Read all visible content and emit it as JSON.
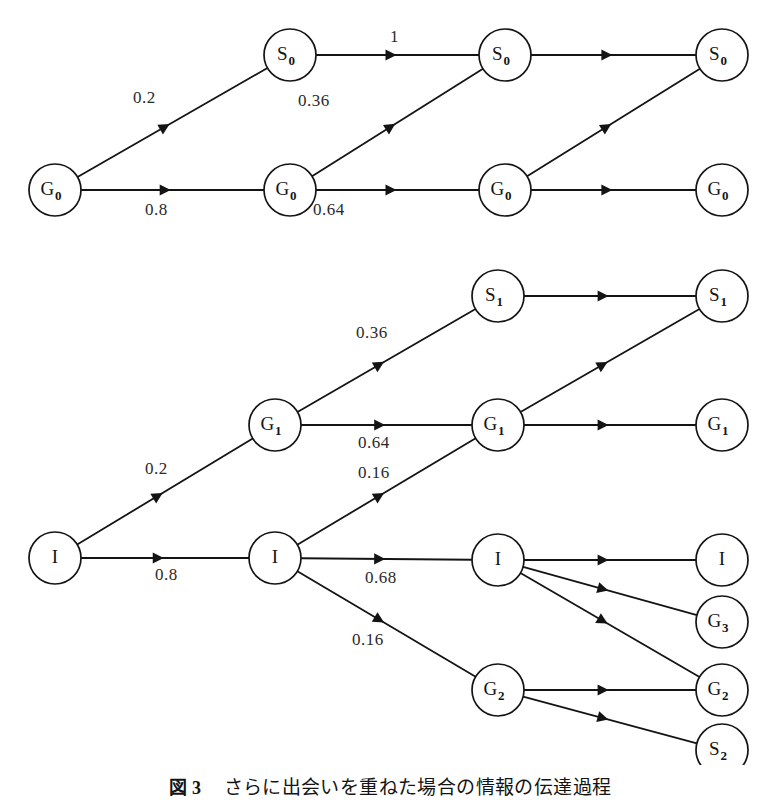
{
  "figure": {
    "caption_number": "図 3",
    "caption_text": "さらに出会いを重ねた場合の情報の伝達過程",
    "background_color": "#ffffff",
    "ink_color": "#141414"
  },
  "diagram_data": {
    "type": "diagram",
    "description": "Two stacked directed layered graphs (trellis diagrams) showing information transmission over repeated encounters; edges carry transition probabilities.",
    "panels": [
      {
        "id": "upper",
        "columns": 4,
        "nodes": [
          {
            "id": "u-c1-G0",
            "label": "G",
            "sub": "0",
            "col": 1,
            "x": 55,
            "y": 190
          },
          {
            "id": "u-c2-S0",
            "label": "S",
            "sub": "0",
            "col": 2,
            "x": 290,
            "y": 55
          },
          {
            "id": "u-c2-G0",
            "label": "G",
            "sub": "0",
            "col": 2,
            "x": 290,
            "y": 190
          },
          {
            "id": "u-c3-S0",
            "label": "S",
            "sub": "0",
            "col": 3,
            "x": 505,
            "y": 55
          },
          {
            "id": "u-c3-G0",
            "label": "G",
            "sub": "0",
            "col": 3,
            "x": 505,
            "y": 190
          },
          {
            "id": "u-c4-S0",
            "label": "S",
            "sub": "0",
            "col": 4,
            "x": 722,
            "y": 55
          },
          {
            "id": "u-c4-G0",
            "label": "G",
            "sub": "0",
            "col": 4,
            "x": 722,
            "y": 190
          }
        ],
        "edges": [
          {
            "from": "u-c1-G0",
            "to": "u-c2-S0",
            "label": "0.2",
            "label_x": 133,
            "label_y": 103
          },
          {
            "from": "u-c1-G0",
            "to": "u-c2-G0",
            "label": "0.8",
            "label_x": 145,
            "label_y": 215
          },
          {
            "from": "u-c2-S0",
            "to": "u-c3-S0",
            "label": "1",
            "label_x": 390,
            "label_y": 42
          },
          {
            "from": "u-c2-G0",
            "to": "u-c3-S0",
            "label": "0.36",
            "label_x": 298,
            "label_y": 106
          },
          {
            "from": "u-c2-G0",
            "to": "u-c3-G0",
            "label": "0.64",
            "label_x": 313,
            "label_y": 215
          },
          {
            "from": "u-c3-S0",
            "to": "u-c4-S0",
            "label": "",
            "label_x": 0,
            "label_y": 0
          },
          {
            "from": "u-c3-G0",
            "to": "u-c4-S0",
            "label": "",
            "label_x": 0,
            "label_y": 0
          },
          {
            "from": "u-c3-G0",
            "to": "u-c4-G0",
            "label": "",
            "label_x": 0,
            "label_y": 0
          }
        ]
      },
      {
        "id": "lower",
        "columns": 4,
        "nodes": [
          {
            "id": "l-c1-I",
            "label": "I",
            "sub": "",
            "col": 1,
            "x": 55,
            "y": 558
          },
          {
            "id": "l-c2-G1",
            "label": "G",
            "sub": "1",
            "col": 2,
            "x": 275,
            "y": 425
          },
          {
            "id": "l-c2-I",
            "label": "I",
            "sub": "",
            "col": 2,
            "x": 275,
            "y": 558
          },
          {
            "id": "l-c3-S1",
            "label": "S",
            "sub": "1",
            "col": 3,
            "x": 498,
            "y": 296
          },
          {
            "id": "l-c3-G1",
            "label": "G",
            "sub": "1",
            "col": 3,
            "x": 498,
            "y": 425
          },
          {
            "id": "l-c3-I",
            "label": "I",
            "sub": "",
            "col": 3,
            "x": 498,
            "y": 560
          },
          {
            "id": "l-c3-G2",
            "label": "G",
            "sub": "2",
            "col": 3,
            "x": 498,
            "y": 690
          },
          {
            "id": "l-c4-S1",
            "label": "S",
            "sub": "1",
            "col": 4,
            "x": 722,
            "y": 296
          },
          {
            "id": "l-c4-G1",
            "label": "G",
            "sub": "1",
            "col": 4,
            "x": 722,
            "y": 425
          },
          {
            "id": "l-c4-I",
            "label": "I",
            "sub": "",
            "col": 4,
            "x": 722,
            "y": 560
          },
          {
            "id": "l-c4-G3",
            "label": "G",
            "sub": "3",
            "col": 4,
            "x": 722,
            "y": 622
          },
          {
            "id": "l-c4-G2",
            "label": "G",
            "sub": "2",
            "col": 4,
            "x": 722,
            "y": 690
          },
          {
            "id": "l-c4-S2",
            "label": "S",
            "sub": "2",
            "col": 4,
            "x": 722,
            "y": 750
          }
        ],
        "edges": [
          {
            "from": "l-c1-I",
            "to": "l-c2-G1",
            "label": "0.2",
            "label_x": 145,
            "label_y": 474
          },
          {
            "from": "l-c1-I",
            "to": "l-c2-I",
            "label": "0.8",
            "label_x": 155,
            "label_y": 580
          },
          {
            "from": "l-c2-G1",
            "to": "l-c3-S1",
            "label": "0.36",
            "label_x": 356,
            "label_y": 338
          },
          {
            "from": "l-c2-G1",
            "to": "l-c3-G1",
            "label": "0.64",
            "label_x": 358,
            "label_y": 448
          },
          {
            "from": "l-c2-I",
            "to": "l-c3-G1",
            "label": "0.16",
            "label_x": 358,
            "label_y": 478
          },
          {
            "from": "l-c2-I",
            "to": "l-c3-I",
            "label": "0.68",
            "label_x": 365,
            "label_y": 583
          },
          {
            "from": "l-c2-I",
            "to": "l-c3-G2",
            "label": "0.16",
            "label_x": 352,
            "label_y": 645
          },
          {
            "from": "l-c3-S1",
            "to": "l-c4-S1",
            "label": "",
            "label_x": 0,
            "label_y": 0
          },
          {
            "from": "l-c3-G1",
            "to": "l-c4-S1",
            "label": "",
            "label_x": 0,
            "label_y": 0
          },
          {
            "from": "l-c3-G1",
            "to": "l-c4-G1",
            "label": "",
            "label_x": 0,
            "label_y": 0
          },
          {
            "from": "l-c3-I",
            "to": "l-c4-I",
            "label": "",
            "label_x": 0,
            "label_y": 0
          },
          {
            "from": "l-c3-I",
            "to": "l-c4-G3",
            "label": "",
            "label_x": 0,
            "label_y": 0
          },
          {
            "from": "l-c3-I",
            "to": "l-c4-G2",
            "label": "",
            "label_x": 0,
            "label_y": 0
          },
          {
            "from": "l-c3-G2",
            "to": "l-c4-G2",
            "label": "",
            "label_x": 0,
            "label_y": 0
          },
          {
            "from": "l-c3-G2",
            "to": "l-c4-S2",
            "label": "",
            "label_x": 0,
            "label_y": 0
          }
        ]
      }
    ],
    "node_radius": 26,
    "edge_labels_all": [
      "0.2",
      "0.8",
      "1",
      "0.36",
      "0.64",
      "0.2",
      "0.8",
      "0.36",
      "0.64",
      "0.16",
      "0.68",
      "0.16"
    ],
    "node_labels_all": [
      "G0",
      "S0",
      "G0",
      "S0",
      "G0",
      "S0",
      "G0",
      "I",
      "G1",
      "I",
      "S1",
      "G1",
      "I",
      "G2",
      "S1",
      "G1",
      "I",
      "G3",
      "G2",
      "S2"
    ]
  }
}
